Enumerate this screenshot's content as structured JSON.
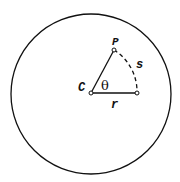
{
  "diagram": {
    "title": "",
    "circle": {
      "cx": 91,
      "cy": 94,
      "r": 80
    },
    "points": {
      "C": {
        "label": "C",
        "x": 91,
        "y": 93
      },
      "P": {
        "label": "P",
        "x": 114,
        "y": 50
      },
      "R": {
        "label": "",
        "x": 137,
        "y": 93
      }
    },
    "labels": {
      "center": "C",
      "point": "P",
      "arc": "s",
      "radius": "r",
      "angle": "θ"
    },
    "colors": {
      "stroke": "#111111",
      "background": "#ffffff"
    }
  }
}
